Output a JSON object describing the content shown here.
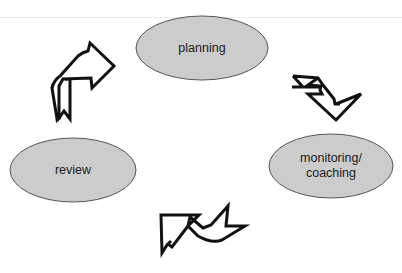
{
  "diagram": {
    "type": "cycle",
    "nodes": [
      {
        "id": "planning",
        "label": "planning",
        "lines": [
          "planning"
        ],
        "cx": 202,
        "cy": 48,
        "rx": 66,
        "ry": 32
      },
      {
        "id": "monitoring",
        "label": "monitoring/ coaching",
        "lines": [
          "monitoring/",
          "coaching"
        ],
        "cx": 331,
        "cy": 166,
        "rx": 62,
        "ry": 32
      },
      {
        "id": "review",
        "label": "review",
        "lines": [
          "review"
        ],
        "cx": 73,
        "cy": 170,
        "rx": 63,
        "ry": 32
      }
    ],
    "edges": [
      {
        "from": "planning",
        "to": "monitoring",
        "icon": "curved-arrow-down-right-icon"
      },
      {
        "from": "monitoring",
        "to": "review",
        "icon": "curved-arrow-down-left-icon"
      },
      {
        "from": "review",
        "to": "planning",
        "icon": "curved-arrow-up-right-icon"
      }
    ],
    "colors": {
      "node_fill": "#cccccc",
      "node_stroke": "#555555",
      "arrow_stroke": "#111111",
      "arrow_fill": "#ffffff",
      "text": "#1a1a1a"
    }
  }
}
